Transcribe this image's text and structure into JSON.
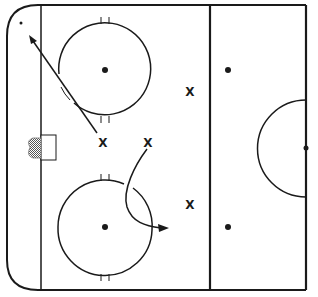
{
  "diagram": {
    "type": "hockey-rink-drill",
    "colors": {
      "line": "#1a1a1a",
      "background": "#ffffff",
      "net_fill": "#999999"
    },
    "players": [
      {
        "label": "X",
        "x": 103,
        "y": 143,
        "role": "skater-with-diagonal-route"
      },
      {
        "label": "X",
        "x": 148,
        "y": 143,
        "role": "skater-with-curved-route"
      },
      {
        "label": "X",
        "x": 190,
        "y": 92,
        "role": "skater"
      },
      {
        "label": "X",
        "x": 190,
        "y": 205,
        "role": "skater"
      }
    ],
    "faceoff_circles": [
      {
        "cx": 105,
        "cy": 70,
        "r": 46
      },
      {
        "cx": 105,
        "cy": 227,
        "r": 47
      }
    ],
    "faceoff_dots": [
      {
        "cx": 105,
        "cy": 70
      },
      {
        "cx": 105,
        "cy": 227
      },
      {
        "cx": 228,
        "cy": 70
      },
      {
        "cx": 228,
        "cy": 227
      },
      {
        "cx": 306,
        "cy": 148
      },
      {
        "cx": 21,
        "cy": 23
      }
    ],
    "routes": [
      {
        "from": [
          97,
          133
        ],
        "to": [
          30,
          37
        ],
        "style": "straight-arrow"
      },
      {
        "from": [
          148,
          150
        ],
        "to": [
          168,
          228
        ],
        "style": "curved-arrow"
      }
    ]
  }
}
